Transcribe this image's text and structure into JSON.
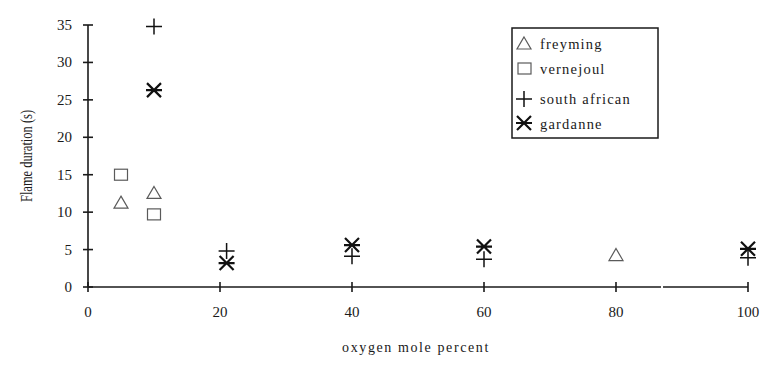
{
  "chart_data": {
    "type": "scatter",
    "title": "",
    "xlabel": "oxygen mole percent",
    "ylabel": "Flame duration (s)",
    "xlim": [
      0,
      100
    ],
    "ylim": [
      0,
      35
    ],
    "xticks": [
      0,
      20,
      40,
      60,
      80,
      100
    ],
    "yticks": [
      0,
      5,
      10,
      15,
      20,
      25,
      30,
      35
    ],
    "grid": false,
    "legend_position": "upper right",
    "series": [
      {
        "name": "freyming",
        "marker": "triangle-open",
        "points": [
          {
            "x": 5,
            "y": 11.2
          },
          {
            "x": 10,
            "y": 12.5
          },
          {
            "x": 80,
            "y": 4.2
          }
        ]
      },
      {
        "name": "vernejoul",
        "marker": "square-open",
        "points": [
          {
            "x": 5,
            "y": 15.0
          },
          {
            "x": 10,
            "y": 9.7
          }
        ]
      },
      {
        "name": "south african",
        "marker": "plus",
        "points": [
          {
            "x": 10,
            "y": 34.8
          },
          {
            "x": 21,
            "y": 4.8
          },
          {
            "x": 40,
            "y": 4.1
          },
          {
            "x": 60,
            "y": 3.7
          },
          {
            "x": 100,
            "y": 3.9
          }
        ]
      },
      {
        "name": "gardanne",
        "marker": "asterisk",
        "points": [
          {
            "x": 10,
            "y": 26.3
          },
          {
            "x": 21,
            "y": 3.2
          },
          {
            "x": 40,
            "y": 5.6
          },
          {
            "x": 60,
            "y": 5.4
          },
          {
            "x": 100,
            "y": 5.1
          }
        ]
      }
    ]
  },
  "legend": {
    "items": [
      {
        "label": "freyming",
        "marker": "triangle-icon"
      },
      {
        "label": "vernejoul",
        "marker": "square-icon"
      },
      {
        "label": "south african",
        "marker": "plus-icon"
      },
      {
        "label": "gardanne",
        "marker": "asterisk-icon"
      }
    ]
  },
  "axes": {
    "x_title": "oxygen mole percent",
    "y_title": "Flame duration (s)",
    "x_tick_labels": [
      "0",
      "20",
      "40",
      "60",
      "80",
      "100"
    ],
    "y_tick_labels": [
      "0",
      "5",
      "10",
      "15",
      "20",
      "25",
      "30",
      "35"
    ]
  }
}
